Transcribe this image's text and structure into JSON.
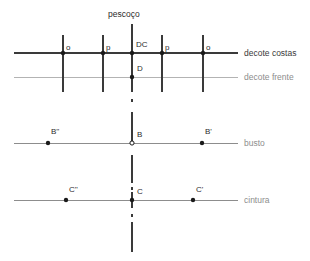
{
  "diagram": {
    "title_label": "pescoço",
    "colors": {
      "dark_line": "#3a3a3a",
      "light_line": "#b3b3b3",
      "mid_line": "#8d8d8d",
      "point_fill": "#1a1a1a",
      "text": "#2b2b2b",
      "text_light": "#8d8d8d",
      "background": "#ffffff"
    },
    "horizontal_lines": [
      {
        "name": "decote-costas",
        "label": "decote costas",
        "y": 53,
        "x1": 14,
        "x2": 238,
        "tone": "dark"
      },
      {
        "name": "decote-frente",
        "label": "decote frente",
        "y": 77,
        "x1": 14,
        "x2": 238,
        "tone": "light"
      },
      {
        "name": "busto",
        "label": "busto",
        "y": 143,
        "x1": 14,
        "x2": 238,
        "tone": "mid"
      },
      {
        "name": "cintura",
        "label": "cintura",
        "y": 200,
        "x1": 14,
        "x2": 238,
        "tone": "mid"
      }
    ],
    "vertical_lines": [
      {
        "name": "vertical-far-left",
        "x": 63,
        "y1": 35,
        "y2": 92
      },
      {
        "name": "vertical-left",
        "x": 103,
        "y1": 35,
        "y2": 92
      },
      {
        "name": "vertical-center-upper",
        "x": 132,
        "y1": 24,
        "y2": 92
      },
      {
        "name": "vertical-right",
        "x": 162,
        "y1": 35,
        "y2": 92
      },
      {
        "name": "vertical-far-right",
        "x": 203,
        "y1": 35,
        "y2": 92
      },
      {
        "name": "vertical-center-busto",
        "x": 132,
        "y1": 112,
        "y2": 143
      },
      {
        "name": "vertical-center-busto-lower",
        "x": 132,
        "y1": 155,
        "y2": 183
      },
      {
        "name": "vertical-center-cintura",
        "x": 132,
        "y1": 192,
        "y2": 208
      },
      {
        "name": "vertical-center-bottom",
        "x": 132,
        "y1": 222,
        "y2": 252
      }
    ],
    "dash_marks": [
      {
        "name": "dash-d-to-b-1",
        "x": 132,
        "y": 100
      },
      {
        "name": "dash-b-to-c",
        "x": 132,
        "y": 188
      },
      {
        "name": "dash-c-to-bottom",
        "x": 132,
        "y": 215
      }
    ],
    "points": [
      {
        "name": "point-o-left",
        "label": "o",
        "x": 63,
        "y": 53,
        "style": "filled",
        "lx": 66,
        "ly": 44
      },
      {
        "name": "point-p-left",
        "label": "p",
        "x": 103,
        "y": 53,
        "style": "filled",
        "lx": 106,
        "ly": 44
      },
      {
        "name": "point-dc",
        "label": "DC",
        "x": 132,
        "y": 53,
        "style": "filled",
        "lx": 136,
        "ly": 41
      },
      {
        "name": "point-p-right",
        "label": "p",
        "x": 162,
        "y": 53,
        "style": "filled",
        "lx": 165,
        "ly": 44
      },
      {
        "name": "point-o-right",
        "label": "o",
        "x": 203,
        "y": 53,
        "style": "filled",
        "lx": 206,
        "ly": 44
      },
      {
        "name": "point-d",
        "label": "D",
        "x": 132,
        "y": 77,
        "style": "filled",
        "lx": 137,
        "ly": 65
      },
      {
        "name": "point-b-left",
        "label": "B''",
        "x": 48,
        "y": 143,
        "style": "filled",
        "lx": 51,
        "ly": 128
      },
      {
        "name": "point-b",
        "label": "B",
        "x": 132,
        "y": 143,
        "style": "hollow",
        "lx": 137,
        "ly": 131
      },
      {
        "name": "point-b-right",
        "label": "B'",
        "x": 202,
        "y": 143,
        "style": "filled",
        "lx": 205,
        "ly": 128
      },
      {
        "name": "point-c-left",
        "label": "C''",
        "x": 66,
        "y": 200,
        "style": "filled",
        "lx": 69,
        "ly": 186
      },
      {
        "name": "point-c",
        "label": "C",
        "x": 132,
        "y": 200,
        "style": "filled",
        "lx": 137,
        "ly": 188
      },
      {
        "name": "point-c-right",
        "label": "C'",
        "x": 193,
        "y": 200,
        "style": "filled",
        "lx": 196,
        "ly": 186
      }
    ],
    "axis_label_x": 244,
    "title_pos": {
      "x": 108,
      "y": 10
    }
  }
}
